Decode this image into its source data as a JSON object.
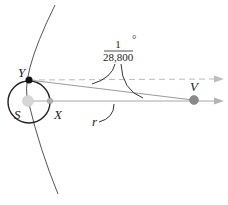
{
  "diagram": {
    "labels": {
      "y": "Y",
      "s": "S",
      "x": "X",
      "v": "V",
      "r": "r"
    },
    "angle": {
      "numerator": "1",
      "denominator": "28,800",
      "unit": "°"
    },
    "colors": {
      "line_dark": "#333333",
      "line_grey": "#a0a0a0",
      "arrow_grey": "#b4b4b4",
      "dashed": "#bdbdbd",
      "sun": "#d6d6d6",
      "planet_v": "#8a8a8a",
      "point_x": "#b0b0b0",
      "point_y": "#111111"
    }
  }
}
